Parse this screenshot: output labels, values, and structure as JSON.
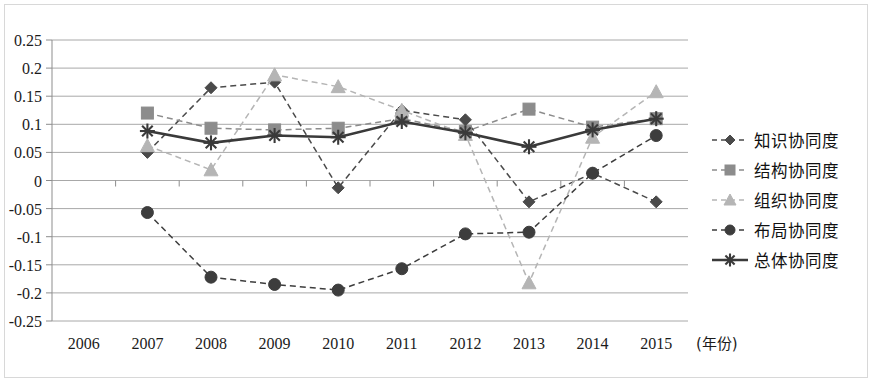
{
  "chart_data": {
    "type": "line",
    "title": "",
    "subtitle": "",
    "xlabel": "(年份)",
    "ylabel": "",
    "categories": [
      "2006",
      "2007",
      "2008",
      "2009",
      "2010",
      "2011",
      "2012",
      "2013",
      "2014",
      "2015"
    ],
    "x_tick_labels": [
      "2006",
      "2007",
      "2008",
      "2009",
      "2010",
      "2011",
      "2012",
      "2013",
      "2014",
      "2015"
    ],
    "y_tick_labels": [
      "0.25",
      "0.2",
      "0.15",
      "0.1",
      "0.05",
      "0",
      "-0.05",
      "-0.1",
      "-0.15",
      "-0.2",
      "-0.25"
    ],
    "y_tick_values": [
      0.25,
      0.2,
      0.15,
      0.1,
      0.05,
      0,
      -0.05,
      -0.1,
      -0.15,
      -0.2,
      -0.25
    ],
    "ylim": [
      -0.25,
      0.25
    ],
    "grid": true,
    "legend_position": "right",
    "series": [
      {
        "name": "知识协同度",
        "marker": "diamond",
        "linestyle": "dashed",
        "color": "#4a4a4a",
        "x": [
          "2007",
          "2008",
          "2009",
          "2010",
          "2011",
          "2012",
          "2013",
          "2014",
          "2015"
        ],
        "values": [
          0.05,
          0.165,
          0.175,
          -0.013,
          0.125,
          0.108,
          -0.038,
          0.013,
          -0.038
        ]
      },
      {
        "name": "结构协同度",
        "marker": "square",
        "linestyle": "dashed",
        "color": "#8c8c8c",
        "x": [
          "2007",
          "2008",
          "2009",
          "2010",
          "2011",
          "2012",
          "2013",
          "2014",
          "2015"
        ],
        "values": [
          0.12,
          0.093,
          0.09,
          0.093,
          0.11,
          0.087,
          0.127,
          0.095,
          0.11
        ]
      },
      {
        "name": "组织协同度",
        "marker": "triangle",
        "linestyle": "dashed",
        "color": "#b5b5b5",
        "x": [
          "2007",
          "2008",
          "2009",
          "2010",
          "2011",
          "2012",
          "2013",
          "2014",
          "2015"
        ],
        "values": [
          0.062,
          0.019,
          0.188,
          0.167,
          0.125,
          0.082,
          -0.182,
          0.077,
          0.158
        ]
      },
      {
        "name": "布局协同度",
        "marker": "circle",
        "linestyle": "dashed",
        "color": "#3d3d3d",
        "x": [
          "2007",
          "2008",
          "2009",
          "2010",
          "2011",
          "2012",
          "2013",
          "2014",
          "2015"
        ],
        "values": [
          -0.057,
          -0.172,
          -0.185,
          -0.195,
          -0.157,
          -0.095,
          -0.092,
          0.013,
          0.08
        ]
      },
      {
        "name": "总体协同度",
        "marker": "asterisk",
        "linestyle": "solid",
        "color": "#3a3a3a",
        "x": [
          "2007",
          "2008",
          "2009",
          "2010",
          "2011",
          "2012",
          "2013",
          "2014",
          "2015"
        ],
        "values": [
          0.088,
          0.067,
          0.08,
          0.077,
          0.105,
          0.085,
          0.06,
          0.09,
          0.11
        ]
      }
    ]
  },
  "legend": {
    "items": [
      {
        "label": "知识协同度"
      },
      {
        "label": "结构协同度"
      },
      {
        "label": "组织协同度"
      },
      {
        "label": "布局协同度"
      },
      {
        "label": "总体协同度"
      }
    ]
  },
  "colors": {
    "grid": "#a8a8a8",
    "axis": "#8d8d8d",
    "frame": "#d8d8d8",
    "text": "#1b1b1b",
    "background": "#ffffff"
  }
}
